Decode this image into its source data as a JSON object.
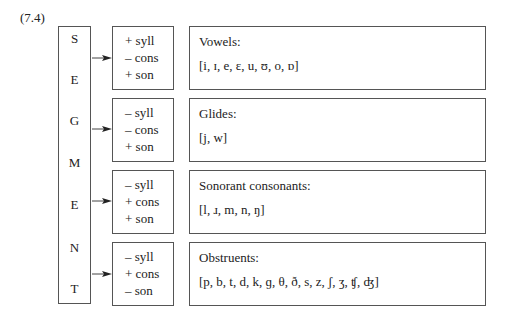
{
  "example_label": "(7.4)",
  "root": {
    "label": "SEGMENT",
    "letters": [
      "S",
      "E",
      "G",
      "M",
      "E",
      "N",
      "T"
    ]
  },
  "rows": [
    {
      "features": [
        "+ syll",
        "– cons",
        "+ son"
      ],
      "category": "Vowels:",
      "members": "[i, ɪ, e, ɛ, u, ʊ, o, ɒ]"
    },
    {
      "features": [
        "– syll",
        "– cons",
        "+ son"
      ],
      "category": "Glides:",
      "members": "[j, w]"
    },
    {
      "features": [
        "– syll",
        "+ cons",
        "+ son"
      ],
      "category": "Sonorant consonants:",
      "members": "[l, ɹ, m, n, ŋ]"
    },
    {
      "features": [
        "– syll",
        "+ cons",
        "– son"
      ],
      "category": "Obstruents:",
      "members": "[p, b, t, d, k, ɡ, θ, ð, s, z, ʃ, ʒ, ʧ, ʤ]"
    }
  ]
}
